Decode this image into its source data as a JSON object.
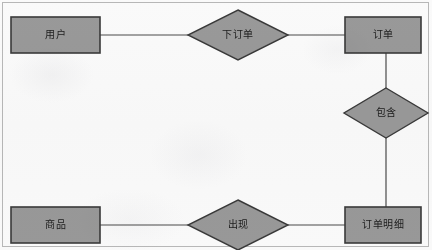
{
  "diagram": {
    "type": "entity-relationship-diagram",
    "title": "",
    "background_color": "#fcfcfc",
    "frame_color": "#b9b9b9",
    "shape_fill_color": "#9a9a9a",
    "shape_stroke_color": "#3a3a3a",
    "connector_color": "#4a4a4a",
    "entities": [
      {
        "id": "user",
        "label": "用户",
        "shape": "rectangle",
        "x": 11,
        "y": 17,
        "width": 89,
        "height": 36
      },
      {
        "id": "order",
        "label": "订单",
        "shape": "rectangle",
        "x": 345,
        "y": 17,
        "width": 76,
        "height": 36
      },
      {
        "id": "product",
        "label": "商品",
        "shape": "rectangle",
        "x": 11,
        "y": 207,
        "width": 89,
        "height": 36
      },
      {
        "id": "order-detail",
        "label": "订单明细",
        "shape": "rectangle",
        "x": 345,
        "y": 207,
        "width": 76,
        "height": 36
      }
    ],
    "relationships": [
      {
        "id": "place-order",
        "label": "下订单",
        "shape": "diamond",
        "cx": 238,
        "cy": 35,
        "rx": 50,
        "ry": 25,
        "connects": [
          "user",
          "order"
        ]
      },
      {
        "id": "contains",
        "label": "包含",
        "shape": "diamond",
        "cx": 386,
        "cy": 113,
        "rx": 42,
        "ry": 25,
        "connects": [
          "order",
          "order-detail"
        ]
      },
      {
        "id": "appears",
        "label": "出现",
        "shape": "diamond",
        "cx": 238,
        "cy": 225,
        "rx": 50,
        "ry": 25,
        "connects": [
          "product",
          "order-detail"
        ]
      }
    ],
    "connectors": [
      {
        "id": "user-to-place-order",
        "x1": 100,
        "y1": 35,
        "x2": 188,
        "y2": 35
      },
      {
        "id": "place-order-to-order",
        "x1": 288,
        "y1": 35,
        "x2": 345,
        "y2": 35
      },
      {
        "id": "order-to-contains",
        "x1": 386,
        "y1": 53,
        "x2": 386,
        "y2": 88
      },
      {
        "id": "contains-to-order-detail",
        "x1": 386,
        "y1": 138,
        "x2": 386,
        "y2": 207
      },
      {
        "id": "product-to-appears",
        "x1": 100,
        "y1": 225,
        "x2": 188,
        "y2": 225
      },
      {
        "id": "appears-to-order-detail",
        "x1": 288,
        "y1": 225,
        "x2": 345,
        "y2": 225
      }
    ]
  }
}
